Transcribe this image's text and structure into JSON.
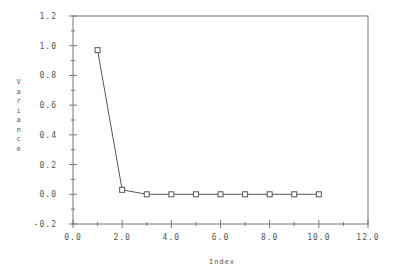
{
  "chart_data": {
    "type": "line",
    "title": "",
    "xlabel": "Index",
    "ylabel": "Variance",
    "xlim": [
      0.0,
      12.0
    ],
    "ylim": [
      -0.2,
      1.2
    ],
    "x_ticks": [
      "0.0",
      "2.0",
      "4.0",
      "6.0",
      "8.0",
      "10.0",
      "12.0"
    ],
    "y_ticks": [
      "-0.2",
      "0.0",
      "0.2",
      "0.4",
      "0.6",
      "0.8",
      "1.0",
      "1.2"
    ],
    "grid": false,
    "legend": null,
    "marker": "square-open",
    "series": [
      {
        "name": "Variance",
        "x": [
          1,
          2,
          3,
          4,
          5,
          6,
          7,
          8,
          9,
          10
        ],
        "values": [
          0.97,
          0.03,
          0.0,
          0.0,
          0.0,
          0.0,
          0.0,
          0.0,
          0.0,
          0.0
        ]
      }
    ]
  },
  "colors": {
    "axis": "#777777",
    "line": "#555555",
    "text": "#555555"
  }
}
